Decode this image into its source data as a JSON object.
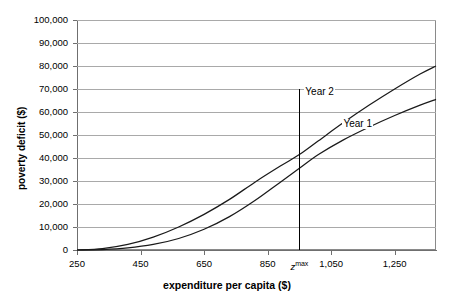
{
  "chart_data": {
    "type": "line",
    "title": "",
    "xlabel": "expenditure per capita ($)",
    "ylabel": "poverty deficit ($)",
    "xlim": [
      250,
      1380
    ],
    "ylim": [
      0,
      100000
    ],
    "grid": true,
    "legend_position": "inline-annotation",
    "x_ticks": [
      {
        "value": 250,
        "label": "250"
      },
      {
        "value": 450,
        "label": "450"
      },
      {
        "value": 650,
        "label": "650"
      },
      {
        "value": 850,
        "label": "850"
      },
      {
        "value": 950,
        "label": "z",
        "superscript": "max",
        "italic": true
      },
      {
        "value": 1050,
        "label": "1,050"
      },
      {
        "value": 1250,
        "label": "1,250"
      }
    ],
    "y_ticks": [
      {
        "value": 0,
        "label": "0"
      },
      {
        "value": 10000,
        "label": "10,000"
      },
      {
        "value": 20000,
        "label": "20,000"
      },
      {
        "value": 30000,
        "label": "30,000"
      },
      {
        "value": 40000,
        "label": "40,000"
      },
      {
        "value": 50000,
        "label": "50,000"
      },
      {
        "value": 60000,
        "label": "60,000"
      },
      {
        "value": 70000,
        "label": "70,000"
      },
      {
        "value": 80000,
        "label": "80,000"
      },
      {
        "value": 90000,
        "label": "90,000"
      },
      {
        "value": 100000,
        "label": "100,000"
      }
    ],
    "annotations": [
      {
        "name": "zmax-marker",
        "type": "vline",
        "x": 950,
        "y_from": 0,
        "y_to": 70000,
        "color": "#000000"
      }
    ],
    "series": [
      {
        "name": "Year 1",
        "label": "Year 1",
        "color": "#1a1a1a",
        "label_x": 1180,
        "label_y": 55000,
        "x": [
          250,
          330,
          410,
          490,
          570,
          650,
          730,
          810,
          890,
          950,
          1010,
          1090,
          1170,
          1250,
          1330,
          1380
        ],
        "y": [
          0,
          200,
          900,
          2400,
          5000,
          9000,
          14500,
          21500,
          29500,
          35500,
          41500,
          48000,
          53500,
          58500,
          63000,
          65500
        ]
      },
      {
        "name": "Year 2",
        "label": "Year 2",
        "color": "#1a1a1a",
        "label_x": 1060,
        "label_y": 68500,
        "x": [
          250,
          330,
          410,
          490,
          570,
          650,
          730,
          810,
          890,
          950,
          1010,
          1090,
          1170,
          1250,
          1330,
          1380
        ],
        "y": [
          0,
          600,
          2400,
          5600,
          10000,
          15500,
          22000,
          29500,
          36500,
          41500,
          47500,
          55500,
          63000,
          70000,
          76500,
          80000
        ]
      }
    ]
  }
}
